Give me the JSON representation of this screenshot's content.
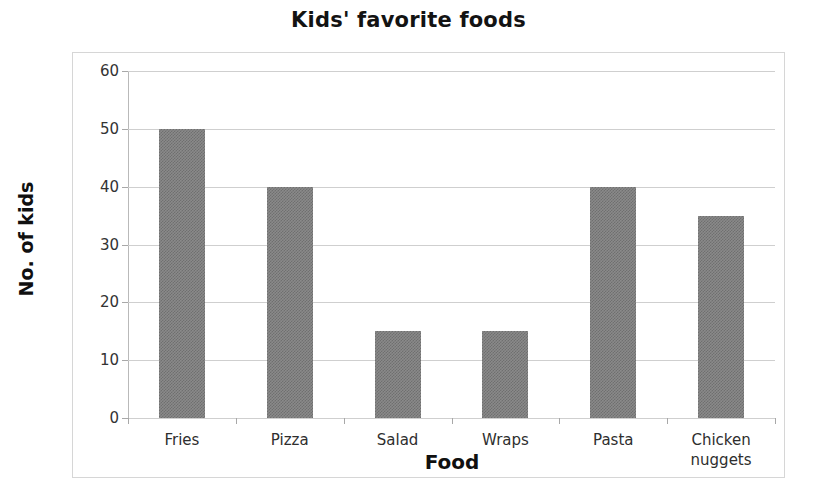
{
  "chart_data": {
    "type": "bar",
    "title": "Kids' favorite foods",
    "xlabel": "Food",
    "ylabel": "No. of kids",
    "categories": [
      "Fries",
      "Pizza",
      "Salad",
      "Wraps",
      "Pasta",
      "Chicken nuggets"
    ],
    "values": [
      50,
      40,
      15,
      15,
      40,
      35
    ],
    "ylim": [
      0,
      60
    ],
    "ytick_labels": [
      "0",
      "10",
      "20",
      "30",
      "40",
      "50",
      "60"
    ],
    "ytick_values": [
      0,
      10,
      20,
      30,
      40,
      50,
      60
    ],
    "grid": true,
    "legend": false,
    "bar_color": "#808080",
    "gridline_color": "#cfcfcf",
    "axis_color": "#a8a8a8",
    "background_color": "#ffffff"
  }
}
